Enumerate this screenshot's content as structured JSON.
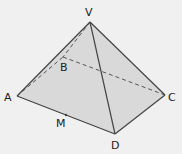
{
  "figure": {
    "type": "pyramid",
    "background": "#f0f0f0",
    "face_fill": "#d9d9d9",
    "edge_color": "#444444",
    "vertices": {
      "V": {
        "label": "V",
        "x": 90,
        "y": 22,
        "lx": 85,
        "ly": 16
      },
      "A": {
        "label": "A",
        "x": 17,
        "y": 96,
        "lx": 4,
        "ly": 101
      },
      "B": {
        "label": "B",
        "x": 63,
        "y": 57,
        "lx": 60,
        "ly": 71
      },
      "C": {
        "label": "C",
        "x": 165,
        "y": 95,
        "lx": 168,
        "ly": 101
      },
      "D": {
        "label": "D",
        "x": 115,
        "y": 134,
        "lx": 111,
        "ly": 149
      },
      "M": {
        "label": "M",
        "x": 66,
        "y": 115,
        "lx": 56,
        "ly": 127
      }
    },
    "visible_edges": [
      "VA",
      "VC",
      "VD",
      "AD",
      "DC"
    ],
    "hidden_edges": [
      "VB",
      "AB",
      "BC"
    ]
  }
}
